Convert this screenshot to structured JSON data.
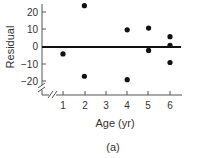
{
  "chart_data": {
    "type": "scatter",
    "title": "",
    "xlabel": "Age (yr)",
    "ylabel": "Residual",
    "caption": "(a)",
    "x_ticks": [
      1,
      2,
      3,
      4,
      5,
      6
    ],
    "y_ticks": [
      20,
      10,
      0,
      -10,
      -20
    ],
    "xlim": [
      0,
      6.5
    ],
    "ylim": [
      -25,
      25
    ],
    "grid": false,
    "reference_line": {
      "y": 0
    },
    "axis_breaks": true,
    "series": [
      {
        "name": "Residuals",
        "points": [
          {
            "x": 1,
            "y": -4
          },
          {
            "x": 2,
            "y": 24
          },
          {
            "x": 2,
            "y": -17
          },
          {
            "x": 4,
            "y": 10
          },
          {
            "x": 4,
            "y": -19
          },
          {
            "x": 5,
            "y": 11
          },
          {
            "x": 5,
            "y": -2
          },
          {
            "x": 6,
            "y": 6
          },
          {
            "x": 6,
            "y": 1
          },
          {
            "x": 6,
            "y": -9
          }
        ]
      }
    ]
  },
  "labels": {
    "ylabel": "Residual",
    "xlabel": "Age (yr)",
    "caption": "(a)",
    "y_tick_labels": [
      "20",
      "10",
      "0",
      "−10",
      "−20"
    ],
    "x_tick_labels": [
      "1",
      "2",
      "3",
      "4",
      "5",
      "6"
    ]
  }
}
